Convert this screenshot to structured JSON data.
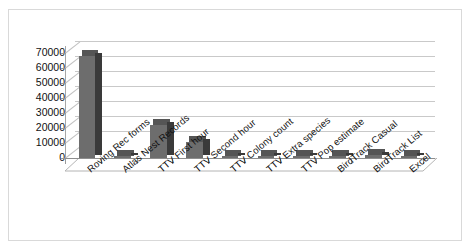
{
  "chart_data": {
    "type": "bar",
    "title": "",
    "xlabel": "",
    "ylabel": "",
    "ylim": [
      0,
      70000
    ],
    "grid": true,
    "legend": "none",
    "style": "3d-column",
    "yticks": [
      "0",
      "10000",
      "20000",
      "30000",
      "40000",
      "50000",
      "60000",
      "70000"
    ],
    "ytick_values": [
      0,
      10000,
      20000,
      30000,
      40000,
      50000,
      60000,
      70000
    ],
    "categories": [
      "Roving Rec forms",
      "Atlas Nest Records",
      "TTV First hour",
      "TTV Second hour",
      "TTV Colony count",
      "TTV Extra species",
      "TTV Pop estimate",
      "BirdTrack Casual",
      "BirdTrack List",
      "Excel"
    ],
    "values": [
      68000,
      700,
      22000,
      11000,
      500,
      500,
      400,
      900,
      1800,
      900
    ],
    "series": [
      {
        "name": "Series 1",
        "values": [
          68000,
          700,
          22000,
          11000,
          500,
          500,
          400,
          900,
          1800,
          900
        ]
      }
    ]
  },
  "colors": {
    "bar_front": "#6d6d6d",
    "bar_side": "#3a3a3a",
    "bar_top": "#555555",
    "gridline": "#c9c9c9",
    "axis": "#8d8d8d",
    "frame_border": "#d9d9d9",
    "background": "#ffffff",
    "text": "#111111"
  }
}
